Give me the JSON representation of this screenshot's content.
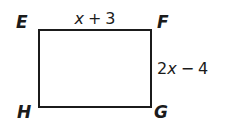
{
  "figure": {
    "shape": "rectangle",
    "stroke_color": "#1b1b1b",
    "fill_color": "#ffffff",
    "vertices": {
      "top_left": "E",
      "top_right": "F",
      "bottom_right": "G",
      "bottom_left": "H"
    },
    "labels": {
      "top_side": "x + 3",
      "right_side": "2x − 4"
    },
    "top_side_parts": {
      "coefficient": "",
      "variable": "x",
      "operator": "+",
      "constant": "3"
    },
    "right_side_parts": {
      "coefficient": "2",
      "variable": "x",
      "operator": "−",
      "constant": "4"
    }
  }
}
